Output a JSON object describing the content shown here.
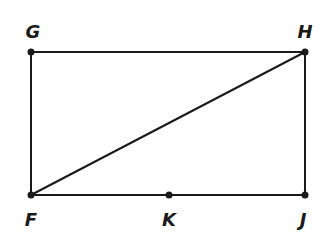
{
  "diagram": {
    "type": "geometry",
    "stroke_color": "#1a1a1a",
    "background": "#ffffff",
    "points": [
      {
        "id": "G",
        "label": "G",
        "x": 31,
        "y": 52,
        "label_x": 33,
        "label_y": 38
      },
      {
        "id": "H",
        "label": "H",
        "x": 305,
        "y": 52,
        "label_x": 305,
        "label_y": 38
      },
      {
        "id": "F",
        "label": "F",
        "x": 31,
        "y": 195,
        "label_x": 31,
        "label_y": 226
      },
      {
        "id": "K",
        "label": "K",
        "x": 169,
        "y": 195,
        "label_x": 169,
        "label_y": 226
      },
      {
        "id": "J",
        "label": "J",
        "x": 305,
        "y": 195,
        "label_x": 303,
        "label_y": 226
      }
    ],
    "segments": [
      {
        "id": "GH",
        "from": "G",
        "to": "H"
      },
      {
        "id": "HJ",
        "from": "H",
        "to": "J"
      },
      {
        "id": "FJ",
        "from": "F",
        "to": "J"
      },
      {
        "id": "GF",
        "from": "G",
        "to": "F"
      },
      {
        "id": "FH",
        "from": "F",
        "to": "H"
      }
    ]
  }
}
